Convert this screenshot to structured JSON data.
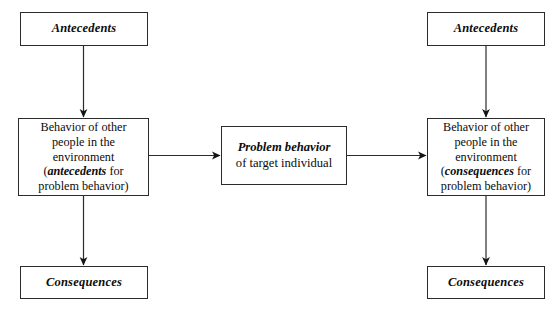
{
  "diagram": {
    "background_color": "#ffffff",
    "line_color": "#2b2b2b",
    "text_color": "#0c0c0c",
    "nodes": {
      "antecedents_left": {
        "label": "Antecedents"
      },
      "environment_left": {
        "line_1": "Behavior of other",
        "line_2": "people in the",
        "line_3": "environment",
        "line_4_prefix": "(",
        "line_4_emphasis": "antecedents",
        "line_4_suffix": " for",
        "line_5": "problem behavior)"
      },
      "consequences_left": {
        "label": "Consequences"
      },
      "problem_behavior": {
        "line_1": "Problem behavior",
        "line_2": "of target individual"
      },
      "antecedents_right": {
        "label": "Antecedents"
      },
      "environment_right": {
        "line_1": "Behavior of other",
        "line_2": "people in the",
        "line_3": "environment",
        "line_4_prefix": "(",
        "line_4_emphasis": "consequences",
        "line_4_suffix": " for",
        "line_5": "problem behavior)"
      },
      "consequences_right": {
        "label": "Consequences"
      }
    },
    "edges": [
      {
        "name": "antecedents-left-to-environment-left",
        "direction": "down"
      },
      {
        "name": "environment-left-to-consequences-left",
        "direction": "down"
      },
      {
        "name": "environment-left-to-problem-behavior",
        "direction": "right"
      },
      {
        "name": "problem-behavior-to-environment-right",
        "direction": "right"
      },
      {
        "name": "antecedents-right-to-environment-right",
        "direction": "down"
      },
      {
        "name": "environment-right-to-consequences-right",
        "direction": "down"
      }
    ]
  }
}
